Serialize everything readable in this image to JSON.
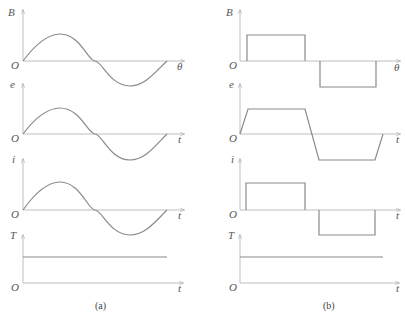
{
  "figure": {
    "panels": [
      {
        "id": "a",
        "caption": "(a)",
        "waveform": "sinusoidal",
        "plots": [
          {
            "y_label": "B",
            "x_label": "θ",
            "origin_label": "O",
            "shape": "sine"
          },
          {
            "y_label": "e",
            "x_label": "t",
            "origin_label": "O",
            "shape": "sine"
          },
          {
            "y_label": "i",
            "x_label": "t",
            "origin_label": "O",
            "shape": "sine"
          },
          {
            "y_label": "T",
            "x_label": "t",
            "origin_label": "O",
            "shape": "constant"
          }
        ]
      },
      {
        "id": "b",
        "caption": "(b)",
        "waveform": "rectangular/trapezoidal",
        "plots": [
          {
            "y_label": "B",
            "x_label": "θ",
            "origin_label": "O",
            "shape": "square"
          },
          {
            "y_label": "e",
            "x_label": "t",
            "origin_label": "O",
            "shape": "trapezoid"
          },
          {
            "y_label": "i",
            "x_label": "t",
            "origin_label": "O",
            "shape": "square"
          },
          {
            "y_label": "T",
            "x_label": "t",
            "origin_label": "O",
            "shape": "constant"
          }
        ]
      }
    ],
    "colors": {
      "axis": "#b8b8b8",
      "curve": "#8a8a8a",
      "text": "#555555"
    }
  }
}
